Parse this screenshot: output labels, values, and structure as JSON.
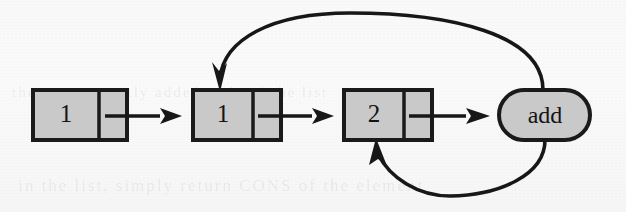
{
  "figure": {
    "kind": "linked-list-diagram",
    "background_color": "#fdfdfd",
    "ink_color": "#171717",
    "node_fill_color": "#c9c9c9"
  },
  "nodes": [
    {
      "id": "node-1",
      "shape": "rect-two-cell",
      "value": "1",
      "x": 33,
      "y": 90,
      "width": 94,
      "height": 50,
      "divider_x": 99,
      "pointer": "next-pointer"
    },
    {
      "id": "node-2",
      "shape": "rect-two-cell",
      "value": "1",
      "x": 193,
      "y": 90,
      "width": 88,
      "height": 50,
      "divider_x": 253,
      "pointer": "next-pointer"
    },
    {
      "id": "node-3",
      "shape": "rect-two-cell",
      "value": "2",
      "x": 344,
      "y": 90,
      "width": 88,
      "height": 50,
      "divider_x": 404,
      "pointer": "next-pointer"
    },
    {
      "id": "node-add",
      "shape": "stadium",
      "value": "add",
      "x": 499,
      "y": 90,
      "width": 91,
      "height": 50
    }
  ],
  "edges": [
    {
      "id": "edge-1-to-2",
      "kind": "straight-arrow",
      "from": "node-1",
      "to": "node-2"
    },
    {
      "id": "edge-2-to-3",
      "kind": "straight-arrow",
      "from": "node-2",
      "to": "node-3"
    },
    {
      "id": "edge-3-to-add",
      "kind": "straight-arrow",
      "from": "node-3",
      "to": "node-add"
    },
    {
      "id": "edge-add-to-2-top",
      "kind": "curved-arrow-over",
      "from": "node-add",
      "to": "node-2"
    },
    {
      "id": "edge-add-to-3-bottom",
      "kind": "curved-arrow-under",
      "from": "node-add",
      "to": "node-3"
    }
  ],
  "bleedthrough": {
    "mid": "the most recently added node of the list",
    "low": "in the list, simply return CONS of the element",
    "high": "/"
  }
}
